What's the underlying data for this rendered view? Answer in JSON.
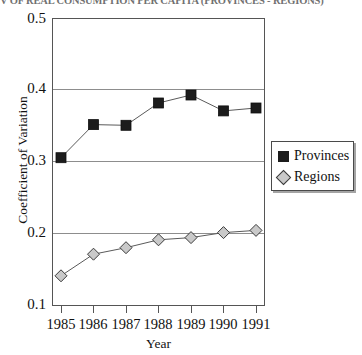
{
  "chart_data": {
    "type": "line",
    "title": "V OF REAL CONSUMPTION PER CAPITA (PROVINCES - REGIONS)",
    "xlabel": "Year",
    "ylabel": "Coefficient of Variation",
    "x": [
      1985,
      1986,
      1987,
      1988,
      1989,
      1990,
      1991
    ],
    "xtick_labels": [
      "1985",
      "1986",
      "1987",
      "1988",
      "1989",
      "1990",
      "1991"
    ],
    "ytick_labels": [
      "0.1",
      "0.2",
      "0.3",
      "0.4",
      "0.5"
    ],
    "ytick_values": [
      0.1,
      0.2,
      0.3,
      0.4,
      0.5
    ],
    "ylim": [
      0.1,
      0.5
    ],
    "grid": true,
    "legend_position": "right",
    "series": [
      {
        "name": "Provinces",
        "marker": "square",
        "marker_color": "#1c1c1c",
        "line_color": "#5a5a5a",
        "values": [
          0.306,
          0.352,
          0.351,
          0.382,
          0.393,
          0.371,
          0.375
        ]
      },
      {
        "name": "Regions",
        "marker": "diamond",
        "marker_color": "#c9c9c9",
        "line_color": "#5a5a5a",
        "values": [
          0.142,
          0.172,
          0.181,
          0.192,
          0.195,
          0.202,
          0.205
        ]
      }
    ]
  },
  "legend": {
    "items": [
      {
        "label": "Provinces"
      },
      {
        "label": "Regions"
      }
    ]
  }
}
